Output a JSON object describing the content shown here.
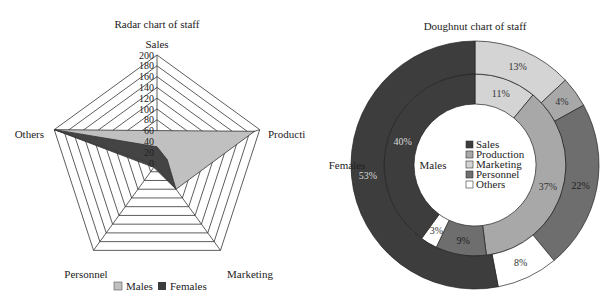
{
  "chart_data": [
    {
      "type": "radar",
      "title": "Radar chart of staff",
      "categories": [
        "Sales",
        "Production",
        "Marketing",
        "Personnel",
        "Others"
      ],
      "rlim": [
        0,
        200
      ],
      "rticks": [
        0,
        20,
        40,
        60,
        80,
        100,
        120,
        140,
        160,
        180,
        200
      ],
      "grid": true,
      "legend_position": "bottom",
      "series": [
        {
          "name": "Males",
          "color": "#c0c0c0",
          "values": [
            60,
            190,
            60,
            5,
            200
          ]
        },
        {
          "name": "Females",
          "color": "#3d3d3d",
          "values": [
            30,
            20,
            60,
            10,
            200
          ]
        }
      ]
    },
    {
      "type": "doughnut",
      "title": "Doughnut chart of staff",
      "categories": [
        "Sales",
        "Production",
        "Marketing",
        "Personnel",
        "Others"
      ],
      "colors": {
        "Sales": "#3d3d3d",
        "Production": "#a8a8a8",
        "Marketing": "#d4d4d4",
        "Personnel": "#6e6e6e",
        "Others": "#ffffff"
      },
      "legend_position": "center",
      "series": [
        {
          "name": "Males",
          "ring": "inner",
          "segments": [
            {
              "category": "Marketing",
              "value": 11,
              "label": "11%"
            },
            {
              "category": "Production",
              "value": 37,
              "label": "37%"
            },
            {
              "category": "Personnel",
              "value": 9,
              "label": "9%"
            },
            {
              "category": "Others",
              "value": 3,
              "label": "3%"
            },
            {
              "category": "Sales",
              "value": 40,
              "label": "40%"
            }
          ]
        },
        {
          "name": "Females",
          "ring": "outer",
          "segments": [
            {
              "category": "Marketing",
              "value": 13,
              "label": "13%"
            },
            {
              "category": "Production",
              "value": 4,
              "label": "4%"
            },
            {
              "category": "Personnel",
              "value": 22,
              "label": "22%"
            },
            {
              "category": "Others",
              "value": 8,
              "label": "8%"
            },
            {
              "category": "Sales",
              "value": 53,
              "label": "53%"
            }
          ]
        }
      ]
    }
  ],
  "radar": {
    "title": "Radar chart of staff",
    "axis_labels": [
      "Sales",
      "Production",
      "Marketing",
      "Personnel",
      "Others"
    ],
    "ticks": [
      "0",
      "20",
      "40",
      "60",
      "80",
      "100",
      "120",
      "140",
      "160",
      "180",
      "200"
    ],
    "legend": [
      {
        "label": "Males",
        "color": "#c0c0c0"
      },
      {
        "label": "Females",
        "color": "#3d3d3d"
      }
    ]
  },
  "doughnut": {
    "title": "Doughnut chart of staff",
    "ring_labels": {
      "outer": "Females",
      "inner": "Males"
    },
    "legend": [
      {
        "label": "Sales",
        "color": "#3d3d3d"
      },
      {
        "label": "Production",
        "color": "#a8a8a8"
      },
      {
        "label": "Marketing",
        "color": "#d4d4d4"
      },
      {
        "label": "Personnel",
        "color": "#6e6e6e"
      },
      {
        "label": "Others",
        "color": "#ffffff"
      }
    ]
  }
}
